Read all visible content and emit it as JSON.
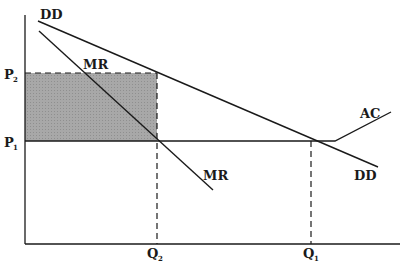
{
  "diagram": {
    "type": "economics-monopolistic-competition",
    "curves": {
      "demand": {
        "label_top": "DD",
        "label_bottom": "DD"
      },
      "marginal_revenue": {
        "label_top": "MR",
        "label_bottom": "MR"
      },
      "average_cost": {
        "label": "AC"
      }
    },
    "axes": {
      "y_ticks": [
        {
          "label": "P",
          "sub": "2"
        },
        {
          "label": "P",
          "sub": "1"
        }
      ],
      "x_ticks": [
        {
          "label": "Q",
          "sub": "2"
        },
        {
          "label": "Q",
          "sub": "1"
        }
      ]
    },
    "shaded_region": {
      "description": "profit rectangle between P1 and P2, from origin to Q2",
      "fill": "#a8a8a8"
    },
    "colors": {
      "ink": "#1a1a1a",
      "shade": "#a8a8a8",
      "background": "#ffffff"
    }
  }
}
